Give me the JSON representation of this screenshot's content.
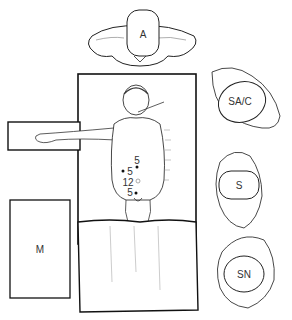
{
  "diagram": {
    "positions": [
      {
        "id": "A",
        "label": "A",
        "role": "anesthesia (head of table)"
      },
      {
        "id": "SAC",
        "label": "SA/C",
        "role": "surgical assistant / camera"
      },
      {
        "id": "S",
        "label": "S",
        "role": "surgeon"
      },
      {
        "id": "SN",
        "label": "SN",
        "role": "scrub nurse"
      }
    ],
    "equipment": [
      {
        "id": "M",
        "label": "M",
        "role": "monitor"
      }
    ],
    "ports": [
      {
        "label": "5",
        "filled": true
      },
      {
        "label": "5",
        "filled": true
      },
      {
        "label": "12",
        "filled": false
      },
      {
        "label": "5",
        "filled": true
      }
    ],
    "colors": {
      "line": "#222222",
      "hatch": "#888888",
      "background": "#ffffff"
    }
  }
}
